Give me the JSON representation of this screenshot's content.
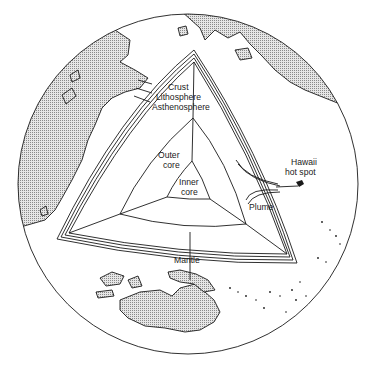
{
  "figure": {
    "type": "cutaway-earth-diagram",
    "labels": {
      "crust": "Crust",
      "lithosphere": "Lithosphere",
      "asthenosphere": "Asthenosphere",
      "outer_core_1": "Outer",
      "outer_core_2": "core",
      "inner_core_1": "Inner",
      "inner_core_2": "core",
      "mantle": "Mantle",
      "plume": "Plume",
      "hawaii_1": "Hawaii",
      "hawaii_2": "hot spot"
    },
    "colors": {
      "ink": "#1a1a1a",
      "background": "#ffffff",
      "land_fill": "#cfcfcf"
    }
  }
}
